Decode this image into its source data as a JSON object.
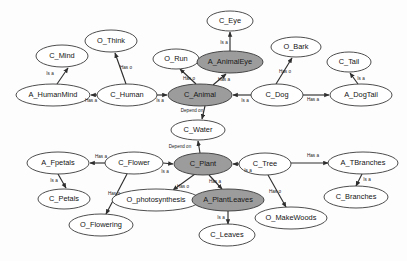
{
  "diagram": {
    "background_color": "#fdfdfd",
    "node_fill_plain": "#ffffff",
    "node_fill_shaded": "#9c9c9c",
    "edge_color": "#2e2e2e",
    "relation_labels": {
      "is_a": "Is a",
      "has_a": "Has a",
      "has_o": "Has o",
      "depend_on": "Depend on"
    },
    "nodes": [
      {
        "id": "C_Mind",
        "label": "C_Mind",
        "x": 62,
        "y": 56,
        "rx": 26,
        "ry": 11,
        "shaded": false
      },
      {
        "id": "O_Think",
        "label": "O_Think",
        "x": 111,
        "y": 41,
        "rx": 26,
        "ry": 11,
        "shaded": false
      },
      {
        "id": "O_Run",
        "label": "O_Run",
        "x": 176,
        "y": 59,
        "rx": 23,
        "ry": 10,
        "shaded": false
      },
      {
        "id": "C_Eye",
        "label": "C_Eye",
        "x": 230,
        "y": 21,
        "rx": 23,
        "ry": 10,
        "shaded": false
      },
      {
        "id": "A_AnimalEye",
        "label": "A_AnimalEye",
        "x": 230,
        "y": 62,
        "rx": 33,
        "ry": 11,
        "shaded": true
      },
      {
        "id": "O_Bark",
        "label": "O_Bark",
        "x": 296,
        "y": 47,
        "rx": 25,
        "ry": 10,
        "shaded": false
      },
      {
        "id": "C_Tail",
        "label": "C_Tail",
        "x": 349,
        "y": 62,
        "rx": 22,
        "ry": 10,
        "shaded": false
      },
      {
        "id": "A_HumanMind",
        "label": "A_HumanMind",
        "x": 53,
        "y": 95,
        "rx": 37,
        "ry": 11,
        "shaded": false
      },
      {
        "id": "C_Human",
        "label": "C_Human",
        "x": 127,
        "y": 95,
        "rx": 30,
        "ry": 11,
        "shaded": false
      },
      {
        "id": "C_Animal",
        "label": "C_Animal",
        "x": 200,
        "y": 95,
        "rx": 32,
        "ry": 11,
        "shaded": true
      },
      {
        "id": "C_Dog",
        "label": "C_Dog",
        "x": 277,
        "y": 95,
        "rx": 26,
        "ry": 11,
        "shaded": false
      },
      {
        "id": "A_DogTail",
        "label": "A_DogTail",
        "x": 361,
        "y": 95,
        "rx": 31,
        "ry": 11,
        "shaded": false
      },
      {
        "id": "C_Water",
        "label": "C_Water",
        "x": 198,
        "y": 130,
        "rx": 27,
        "ry": 10,
        "shaded": false
      },
      {
        "id": "A_Fpetals",
        "label": "A_Fpetals",
        "x": 58,
        "y": 163,
        "rx": 31,
        "ry": 11,
        "shaded": false
      },
      {
        "id": "C_Flower",
        "label": "C_Flower",
        "x": 134,
        "y": 163,
        "rx": 29,
        "ry": 11,
        "shaded": false
      },
      {
        "id": "C_Plant",
        "label": "C_Plant",
        "x": 203,
        "y": 164,
        "rx": 29,
        "ry": 11,
        "shaded": true
      },
      {
        "id": "C_Tree",
        "label": "C_Tree",
        "x": 265,
        "y": 164,
        "rx": 26,
        "ry": 11,
        "shaded": false
      },
      {
        "id": "A_TBranches",
        "label": "A_TBranches",
        "x": 363,
        "y": 163,
        "rx": 35,
        "ry": 11,
        "shaded": false
      },
      {
        "id": "C_Petals",
        "label": "C_Petals",
        "x": 64,
        "y": 199,
        "rx": 26,
        "ry": 10,
        "shaded": false
      },
      {
        "id": "O_photosynthesis",
        "label": "O_photosynthesis",
        "x": 156,
        "y": 200,
        "rx": 44,
        "ry": 11,
        "shaded": false
      },
      {
        "id": "A_PlantLeaves",
        "label": "A_PlantLeaves",
        "x": 228,
        "y": 200,
        "rx": 36,
        "ry": 11,
        "shaded": true
      },
      {
        "id": "C_Branches",
        "label": "C_Branches",
        "x": 356,
        "y": 197,
        "rx": 32,
        "ry": 11,
        "shaded": false
      },
      {
        "id": "O_Flowering",
        "label": "O_Flowering",
        "x": 101,
        "y": 225,
        "rx": 32,
        "ry": 11,
        "shaded": false
      },
      {
        "id": "O_MakeWoods",
        "label": "O_MakeWoods",
        "x": 291,
        "y": 218,
        "rx": 36,
        "ry": 11,
        "shaded": false
      },
      {
        "id": "C_Leaves",
        "label": "C_Leaves",
        "x": 227,
        "y": 235,
        "rx": 28,
        "ry": 11,
        "shaded": false
      }
    ],
    "edges": [
      {
        "from": "A_HumanMind",
        "to": "C_Mind",
        "label": "Is a",
        "lx": 50,
        "ly": 74,
        "x1": 57,
        "y1": 84,
        "x2": 68,
        "y2": 68
      },
      {
        "from": "C_Human",
        "to": "O_Think",
        "label": "Has o",
        "lx": 126,
        "ly": 68,
        "x1": 126,
        "y1": 84,
        "x2": 115,
        "y2": 53
      },
      {
        "from": "C_Human",
        "to": "A_HumanMind",
        "label": "Has a",
        "lx": 91,
        "ly": 101,
        "x1": 97,
        "y1": 95,
        "x2": 91,
        "y2": 95
      },
      {
        "from": "C_Human",
        "to": "C_Animal",
        "label": "Is a",
        "lx": 160,
        "ly": 101,
        "x1": 157,
        "y1": 95,
        "x2": 167,
        "y2": 95
      },
      {
        "from": "C_Animal",
        "to": "O_Run",
        "label": "Has o",
        "lx": 189,
        "ly": 79,
        "x1": 196,
        "y1": 84,
        "x2": 180,
        "y2": 69
      },
      {
        "from": "C_Animal",
        "to": "A_AnimalEye",
        "label": "Has a",
        "lx": 224,
        "ly": 80,
        "x1": 213,
        "y1": 85,
        "x2": 226,
        "y2": 74
      },
      {
        "from": "A_AnimalEye",
        "to": "C_Eye",
        "label": "Is a",
        "lx": 224,
        "ly": 43,
        "x1": 230,
        "y1": 51,
        "x2": 230,
        "y2": 32
      },
      {
        "from": "C_Animal",
        "to": "C_Water",
        "label": "Depend on",
        "lx": 192,
        "ly": 111,
        "x1": 205,
        "y1": 106,
        "x2": 202,
        "y2": 119
      },
      {
        "from": "C_Dog",
        "to": "C_Animal",
        "label": "Is a",
        "lx": 245,
        "ly": 101,
        "x1": 251,
        "y1": 95,
        "x2": 233,
        "y2": 95
      },
      {
        "from": "C_Dog",
        "to": "O_Bark",
        "label": "Has o",
        "lx": 285,
        "ly": 72,
        "x1": 276,
        "y1": 84,
        "x2": 292,
        "y2": 58
      },
      {
        "from": "C_Dog",
        "to": "A_DogTail",
        "label": "Has a",
        "lx": 313,
        "ly": 100,
        "x1": 303,
        "y1": 95,
        "x2": 329,
        "y2": 95
      },
      {
        "from": "A_DogTail",
        "to": "C_Tail",
        "label": "Is a",
        "lx": 361,
        "ly": 79,
        "x1": 358,
        "y1": 84,
        "x2": 350,
        "y2": 73
      },
      {
        "from": "C_Plant",
        "to": "C_Water",
        "label": "Depend on",
        "lx": 180,
        "ly": 147,
        "x1": 200,
        "y1": 153,
        "x2": 198,
        "y2": 141
      },
      {
        "from": "C_Flower",
        "to": "A_Fpetals",
        "label": "Has a",
        "lx": 101,
        "ly": 157,
        "x1": 105,
        "y1": 163,
        "x2": 90,
        "y2": 163
      },
      {
        "from": "A_Fpetals",
        "to": "C_Petals",
        "label": "Is a",
        "lx": 54,
        "ly": 181,
        "x1": 58,
        "y1": 174,
        "x2": 66,
        "y2": 188
      },
      {
        "from": "C_Flower",
        "to": "O_Flowering",
        "label": "Has o",
        "lx": 114,
        "ly": 194,
        "x1": 127,
        "y1": 174,
        "x2": 106,
        "y2": 214
      },
      {
        "from": "C_Flower",
        "to": "C_Plant",
        "label": "Is a",
        "lx": 165,
        "ly": 172,
        "x1": 163,
        "y1": 163,
        "x2": 173,
        "y2": 164
      },
      {
        "from": "C_Plant",
        "to": "O_photosynthesis",
        "label": "Has o",
        "lx": 183,
        "ly": 187,
        "x1": 195,
        "y1": 174,
        "x2": 173,
        "y2": 190
      },
      {
        "from": "C_Plant",
        "to": "A_PlantLeaves",
        "label": "Has a",
        "lx": 215,
        "ly": 182,
        "x1": 209,
        "y1": 175,
        "x2": 222,
        "y2": 189
      },
      {
        "from": "A_PlantLeaves",
        "to": "C_Leaves",
        "label": "Is a",
        "lx": 221,
        "ly": 218,
        "x1": 228,
        "y1": 211,
        "x2": 228,
        "y2": 224
      },
      {
        "from": "C_Tree",
        "to": "C_Plant",
        "label": "Is a",
        "lx": 248,
        "ly": 171,
        "x1": 239,
        "y1": 164,
        "x2": 233,
        "y2": 164
      },
      {
        "from": "C_Tree",
        "to": "A_TBranches",
        "label": "Has a",
        "lx": 313,
        "ly": 156,
        "x1": 291,
        "y1": 163,
        "x2": 328,
        "y2": 163
      },
      {
        "from": "C_Tree",
        "to": "O_MakeWoods",
        "label": "Has o",
        "lx": 275,
        "ly": 192,
        "x1": 268,
        "y1": 175,
        "x2": 286,
        "y2": 207
      },
      {
        "from": "A_TBranches",
        "to": "C_Branches",
        "label": "Is a",
        "lx": 367,
        "ly": 180,
        "x1": 362,
        "y1": 174,
        "x2": 356,
        "y2": 186
      }
    ]
  }
}
